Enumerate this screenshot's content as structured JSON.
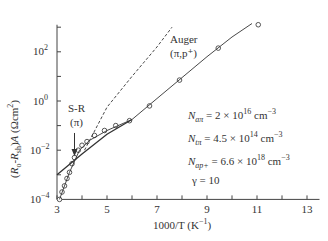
{
  "chart_data": {
    "type": "scatter",
    "title": "",
    "xlabel": "1000/T (K⁻¹)",
    "ylabel": "(R₀-R_sh)A (Ωcm²)",
    "xlim": [
      3,
      13.5
    ],
    "ylim_log10": [
      -4,
      3.1
    ],
    "y_scale": "log",
    "grid": false,
    "x_ticks": [
      3,
      5,
      7,
      9,
      11,
      13
    ],
    "x_tick_labels": [
      "3",
      "5",
      "7",
      "9",
      "11",
      "13"
    ],
    "y_ticks_log10": [
      -4,
      -2,
      0,
      2
    ],
    "y_tick_labels": [
      "10⁻⁴",
      "10⁻²",
      "10⁰",
      "10²"
    ],
    "series": [
      {
        "name": "Measured",
        "style": "open-circle",
        "x": [
          3.1,
          3.2,
          3.3,
          3.4,
          3.5,
          3.6,
          3.7,
          3.85,
          4.0,
          4.2,
          4.5,
          4.9,
          5.35,
          5.9,
          6.7,
          7.9,
          9.45,
          11.05
        ],
        "log10_y": [
          -4.0,
          -3.7,
          -3.45,
          -3.15,
          -2.9,
          -2.55,
          -2.3,
          -2.0,
          -1.8,
          -1.65,
          -1.4,
          -1.2,
          -1.0,
          -0.8,
          -0.2,
          0.85,
          2.15,
          3.1
        ]
      },
      {
        "name": "S-R (π)",
        "style": "solid-line",
        "x": [
          3.0,
          4.0,
          5.0,
          6.0
        ],
        "log10_y": [
          -3.0,
          -2.15,
          -1.35,
          -0.75
        ]
      },
      {
        "name": "Auger (π,p⁺)",
        "style": "dashed-line",
        "x": [
          4.1,
          5.0,
          6.0,
          7.0,
          7.6
        ],
        "log10_y": [
          -2.0,
          -0.25,
          1.0,
          2.2,
          3.0
        ]
      },
      {
        "name": "Total fit",
        "style": "solid-line",
        "x": [
          3.1,
          3.5,
          3.9,
          4.3,
          5.0,
          6.0,
          7.0,
          8.0,
          9.0,
          10.0,
          10.8
        ],
        "log10_y": [
          -4.0,
          -2.9,
          -2.0,
          -1.6,
          -1.2,
          -0.75,
          0.1,
          0.95,
          1.8,
          2.6,
          3.15
        ]
      }
    ],
    "annotations": [
      {
        "text": "Auger",
        "x": 6.3,
        "log10_y": 1.6
      },
      {
        "text": "(π,p⁺)",
        "x": 6.3,
        "log10_y": 1.0
      },
      {
        "text": "S-R",
        "x": 3.7,
        "log10_y": -0.7
      },
      {
        "text": "(π)",
        "x": 3.7,
        "log10_y": -1.2
      }
    ]
  },
  "labels": {
    "y_axis": "(R₀-R_sh)A (Ωcm²)",
    "x_axis": "1000/T (K⁻¹)",
    "auger_line1": "Auger",
    "auger_line2": "(π,p⁺)",
    "sr_line1": "S-R",
    "sr_line2": "(π)"
  },
  "x_ticks": [
    "3",
    "5",
    "7",
    "9",
    "11",
    "13"
  ],
  "parameters": {
    "N_an": "N_aπ = 2 × 10¹⁶ cm⁻³",
    "N_tn": "N_tπ = 4.5 × 10¹⁴ cm⁻³",
    "N_ap": "N_ap+ = 6.6 × 10¹⁸ cm⁻³",
    "gamma": "γ = 10"
  }
}
